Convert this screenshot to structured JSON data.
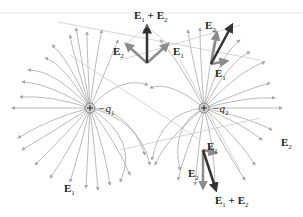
{
  "figure": {
    "charges": [
      {
        "id": "q1",
        "label": "q",
        "subscript": "1",
        "sign": "+",
        "x": 90,
        "y": 108
      },
      {
        "id": "q2",
        "label": "q",
        "subscript": "2",
        "sign": "+",
        "x": 204,
        "y": 108
      }
    ],
    "vector_labels": {
      "top_sum": {
        "main": "E",
        "sub1": "1",
        "plus": " + ",
        "main2": "E",
        "sub2": "2"
      },
      "top_e1": {
        "main": "E",
        "sub": "1"
      },
      "top_e2": {
        "main": "E",
        "sub": "2"
      },
      "upper_right_e1": {
        "main": "E",
        "sub": "1"
      },
      "upper_right_e2": {
        "main": "E",
        "sub": "2"
      },
      "lower_right_e1": {
        "main": "E",
        "sub": "1"
      },
      "lower_right_e2": {
        "main": "E",
        "sub": "2"
      },
      "lower_sum": {
        "main": "E",
        "sub1": "1",
        "plus": " + ",
        "main2": "E",
        "sub2": "2"
      },
      "field_e1": {
        "main": "E",
        "sub": "1"
      },
      "field_e2": {
        "main": "E",
        "sub": "2"
      }
    },
    "colors": {
      "field_line": "#a8a8a8",
      "e_vector": "#8c8c8c",
      "sum_vector": "#333333",
      "charge_fill": "#d0d0d0"
    }
  }
}
